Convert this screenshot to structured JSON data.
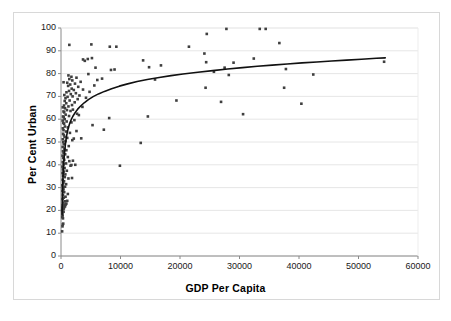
{
  "chart_data": {
    "type": "scatter",
    "title": "",
    "xlabel": "GDP Per Capita",
    "ylabel": "Per Cent Urban",
    "xlim": [
      0,
      60000
    ],
    "ylim": [
      0,
      100
    ],
    "xticks": [
      "0",
      "10000",
      "20000",
      "30000",
      "40000",
      "50000",
      "60000"
    ],
    "xtick_values": [
      0,
      10000,
      20000,
      30000,
      40000,
      50000,
      60000
    ],
    "yticks": [
      "0",
      "10",
      "20",
      "30",
      "40",
      "50",
      "60",
      "70",
      "80",
      "90",
      "100"
    ],
    "ytick_values": [
      0,
      10,
      20,
      30,
      40,
      50,
      60,
      70,
      80,
      90,
      100
    ],
    "grid": "horizontal",
    "legend": "none",
    "marker_color": "#3f3f3f",
    "marker_shape": "square",
    "marker_size": 2.6,
    "trendline": {
      "type": "logarithmic",
      "color": "#111111",
      "width": 1.6,
      "points": [
        [
          180,
          18.0
        ],
        [
          220,
          24.0
        ],
        [
          260,
          29.0
        ],
        [
          300,
          32.5
        ],
        [
          340,
          35.0
        ],
        [
          400,
          38.0
        ],
        [
          460,
          40.5
        ],
        [
          540,
          43.5
        ],
        [
          620,
          46.0
        ],
        [
          720,
          48.5
        ],
        [
          830,
          50.8
        ],
        [
          950,
          52.8
        ],
        [
          1100,
          54.8
        ],
        [
          1300,
          56.8
        ],
        [
          1500,
          58.4
        ],
        [
          1750,
          60.0
        ],
        [
          2000,
          61.3
        ],
        [
          2400,
          63.0
        ],
        [
          2800,
          64.4
        ],
        [
          3300,
          65.8
        ],
        [
          3900,
          67.2
        ],
        [
          4600,
          68.6
        ],
        [
          5400,
          69.9
        ],
        [
          6300,
          71.1
        ],
        [
          7300,
          72.2
        ],
        [
          8500,
          73.4
        ],
        [
          9800,
          74.5
        ],
        [
          11200,
          75.5
        ],
        [
          12800,
          76.5
        ],
        [
          14500,
          77.4
        ],
        [
          16500,
          78.3
        ],
        [
          18500,
          79.1
        ],
        [
          20500,
          79.8
        ],
        [
          23000,
          80.6
        ],
        [
          25500,
          81.3
        ],
        [
          28000,
          82.0
        ],
        [
          30500,
          82.6
        ],
        [
          33000,
          83.2
        ],
        [
          35500,
          83.7
        ],
        [
          38000,
          84.2
        ],
        [
          40500,
          84.7
        ],
        [
          43000,
          85.1
        ],
        [
          45500,
          85.5
        ],
        [
          48000,
          85.9
        ],
        [
          50500,
          86.3
        ],
        [
          53000,
          86.7
        ],
        [
          54500,
          86.9
        ]
      ]
    },
    "points": [
      [
        190,
        10.8
      ],
      [
        250,
        13.0
      ],
      [
        300,
        13.8
      ],
      [
        370,
        14.2
      ],
      [
        330,
        16.5
      ],
      [
        210,
        17.0
      ],
      [
        280,
        17.8
      ],
      [
        260,
        19.0
      ],
      [
        430,
        19.4
      ],
      [
        200,
        20.0
      ],
      [
        350,
        20.5
      ],
      [
        470,
        20.8
      ],
      [
        240,
        21.2
      ],
      [
        560,
        21.5
      ],
      [
        680,
        21.8
      ],
      [
        300,
        22.2
      ],
      [
        520,
        22.5
      ],
      [
        800,
        22.6
      ],
      [
        900,
        23.0
      ],
      [
        390,
        23.4
      ],
      [
        620,
        24.0
      ],
      [
        1050,
        24.2
      ],
      [
        280,
        25.0
      ],
      [
        470,
        25.6
      ],
      [
        760,
        26.0
      ],
      [
        330,
        26.8
      ],
      [
        1150,
        27.2
      ],
      [
        540,
        28.0
      ],
      [
        250,
        28.6
      ],
      [
        420,
        29.2
      ],
      [
        300,
        30.0
      ],
      [
        680,
        30.4
      ],
      [
        230,
        31.0
      ],
      [
        860,
        31.5
      ],
      [
        390,
        32.0
      ],
      [
        510,
        32.8
      ],
      [
        280,
        33.4
      ],
      [
        1250,
        34.0
      ],
      [
        640,
        34.6
      ],
      [
        1850,
        34.2
      ],
      [
        350,
        35.2
      ],
      [
        730,
        35.8
      ],
      [
        260,
        36.4
      ],
      [
        470,
        37.0
      ],
      [
        980,
        37.4
      ],
      [
        320,
        38.0
      ],
      [
        600,
        38.6
      ],
      [
        240,
        39.2
      ],
      [
        1600,
        39.6
      ],
      [
        1750,
        39.9
      ],
      [
        420,
        40.2
      ],
      [
        2400,
        40.0
      ],
      [
        850,
        40.6
      ],
      [
        300,
        41.2
      ],
      [
        1400,
        41.6
      ],
      [
        2000,
        41.8
      ],
      [
        540,
        42.2
      ],
      [
        360,
        43.0
      ],
      [
        1150,
        43.4
      ],
      [
        9900,
        39.6
      ],
      [
        260,
        44.0
      ],
      [
        700,
        44.6
      ],
      [
        430,
        45.2
      ],
      [
        330,
        46.0
      ],
      [
        900,
        46.4
      ],
      [
        580,
        47.0
      ],
      [
        280,
        47.8
      ],
      [
        1300,
        48.2
      ],
      [
        460,
        49.0
      ],
      [
        13400,
        49.6
      ],
      [
        380,
        50.0
      ],
      [
        760,
        50.4
      ],
      [
        1900,
        50.8
      ],
      [
        300,
        51.2
      ],
      [
        2150,
        51.5
      ],
      [
        1050,
        51.8
      ],
      [
        600,
        52.2
      ],
      [
        3400,
        51.6
      ],
      [
        480,
        53.0
      ],
      [
        350,
        53.6
      ],
      [
        1500,
        54.0
      ],
      [
        850,
        54.6
      ],
      [
        2600,
        54.8
      ],
      [
        420,
        55.2
      ],
      [
        7200,
        55.4
      ],
      [
        310,
        56.0
      ],
      [
        1150,
        56.4
      ],
      [
        660,
        56.8
      ],
      [
        5300,
        57.4
      ],
      [
        520,
        58.0
      ],
      [
        390,
        58.4
      ],
      [
        1750,
        58.6
      ],
      [
        950,
        59.0
      ],
      [
        280,
        59.4
      ],
      [
        2250,
        59.6
      ],
      [
        620,
        60.0
      ],
      [
        8100,
        60.5
      ],
      [
        460,
        60.8
      ],
      [
        340,
        61.2
      ],
      [
        1350,
        61.4
      ],
      [
        14600,
        61.2
      ],
      [
        780,
        62.0
      ],
      [
        3000,
        61.8
      ],
      [
        30600,
        62.2
      ],
      [
        2700,
        62.4
      ],
      [
        540,
        63.0
      ],
      [
        420,
        63.4
      ],
      [
        1600,
        63.6
      ],
      [
        1000,
        64.0
      ],
      [
        2000,
        64.2
      ],
      [
        680,
        64.8
      ],
      [
        300,
        65.2
      ],
      [
        1250,
        65.6
      ],
      [
        3600,
        65.4
      ],
      [
        500,
        66.0
      ],
      [
        1850,
        66.2
      ],
      [
        40400,
        66.8
      ],
      [
        880,
        67.0
      ],
      [
        2300,
        67.4
      ],
      [
        26900,
        67.6
      ],
      [
        620,
        68.0
      ],
      [
        1450,
        68.2
      ],
      [
        19400,
        68.2
      ],
      [
        2800,
        68.8
      ],
      [
        760,
        69.2
      ],
      [
        4200,
        69.4
      ],
      [
        1100,
        69.8
      ],
      [
        1950,
        70.0
      ],
      [
        3100,
        70.4
      ],
      [
        560,
        70.6
      ],
      [
        1650,
        71.0
      ],
      [
        2500,
        71.4
      ],
      [
        920,
        71.8
      ],
      [
        4800,
        72.0
      ],
      [
        1350,
        72.4
      ],
      [
        2150,
        72.8
      ],
      [
        3700,
        73.0
      ],
      [
        1800,
        73.4
      ],
      [
        24300,
        73.8
      ],
      [
        37500,
        73.8
      ],
      [
        2900,
        74.2
      ],
      [
        1200,
        74.6
      ],
      [
        5600,
        74.8
      ],
      [
        1550,
        75.2
      ],
      [
        2350,
        75.6
      ],
      [
        1050,
        76.0
      ],
      [
        430,
        76.2
      ],
      [
        3300,
        76.4
      ],
      [
        1900,
        77.0
      ],
      [
        6100,
        77.2
      ],
      [
        15800,
        77.4
      ],
      [
        1400,
        77.6
      ],
      [
        6900,
        77.8
      ],
      [
        2600,
        78.2
      ],
      [
        1750,
        78.6
      ],
      [
        28200,
        79.4
      ],
      [
        42400,
        79.6
      ],
      [
        4600,
        79.8
      ],
      [
        1250,
        79.2
      ],
      [
        8400,
        81.6
      ],
      [
        25700,
        80.8
      ],
      [
        37800,
        82.0
      ],
      [
        9000,
        81.8
      ],
      [
        27500,
        82.6
      ],
      [
        16800,
        83.6
      ],
      [
        14800,
        82.8
      ],
      [
        5800,
        82.6
      ],
      [
        29000,
        84.8
      ],
      [
        24400,
        85.0
      ],
      [
        54300,
        85.2
      ],
      [
        4000,
        85.6
      ],
      [
        13800,
        85.8
      ],
      [
        3700,
        86.2
      ],
      [
        4500,
        86.4
      ],
      [
        32400,
        86.6
      ],
      [
        5200,
        86.8
      ],
      [
        24100,
        88.8
      ],
      [
        5100,
        92.8
      ],
      [
        21500,
        91.8
      ],
      [
        8200,
        91.8
      ],
      [
        9300,
        91.8
      ],
      [
        1400,
        92.6
      ],
      [
        36700,
        93.4
      ],
      [
        24500,
        97.4
      ],
      [
        27800,
        99.6
      ],
      [
        33400,
        99.6
      ],
      [
        34400,
        99.6
      ]
    ]
  }
}
